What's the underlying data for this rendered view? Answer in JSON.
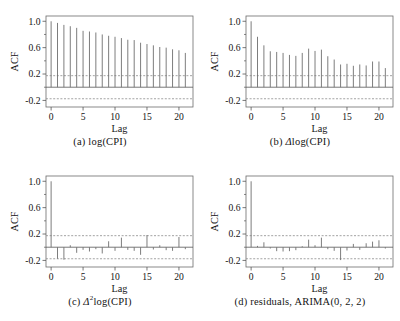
{
  "figure": {
    "background": "#ffffff",
    "stem_color": "#6e6e6e",
    "axis_color": "#555555",
    "bound_color": "#8c8c8c",
    "frame_color": "#6b6b6b"
  },
  "panels": [
    {
      "key": "a",
      "caption_prefix": "(a)",
      "caption_text": "log(CPI)",
      "caption_delta": "",
      "caption_sup": ""
    },
    {
      "key": "b",
      "caption_prefix": "(b)",
      "caption_text": "log(CPI)",
      "caption_delta": "Δ",
      "caption_sup": ""
    },
    {
      "key": "c",
      "caption_prefix": "(c)",
      "caption_text": "log(CPI)",
      "caption_delta": "Δ",
      "caption_sup": "2"
    },
    {
      "key": "d",
      "caption_prefix": "(d)",
      "caption_text": "residuals, ARIMA(0, 2, 2)",
      "caption_delta": "",
      "caption_sup": ""
    }
  ],
  "chart_data": [
    {
      "id": "a",
      "type": "bar",
      "title": "(a) log(CPI)",
      "xlabel": "Lag",
      "ylabel": "ACF",
      "xlim": [
        -0.8,
        22.2
      ],
      "ylim": [
        -0.3,
        1.08
      ],
      "xticks": [
        0,
        5,
        10,
        15,
        20
      ],
      "yticks": [
        -0.2,
        0.2,
        0.6,
        1.0
      ],
      "ytick_labels": [
        "-0.2",
        "0.2",
        "0.6",
        "1.0"
      ],
      "grid": false,
      "legend": "none",
      "confidence_bounds": [
        0.175,
        -0.175
      ],
      "zero_line": 0,
      "x": [
        0,
        1,
        2,
        3,
        4,
        5,
        6,
        7,
        8,
        9,
        10,
        11,
        12,
        13,
        14,
        15,
        16,
        17,
        18,
        19,
        20,
        21
      ],
      "values": [
        1.0,
        0.975,
        0.945,
        0.925,
        0.9,
        0.855,
        0.845,
        0.83,
        0.8,
        0.78,
        0.765,
        0.745,
        0.72,
        0.715,
        0.675,
        0.655,
        0.635,
        0.61,
        0.6,
        0.575,
        0.56,
        0.52
      ]
    },
    {
      "id": "b",
      "type": "bar",
      "title": "(b) Δlog(CPI)",
      "xlabel": "Lag",
      "ylabel": "ACF",
      "xlim": [
        -0.8,
        22.2
      ],
      "ylim": [
        -0.3,
        1.08
      ],
      "xticks": [
        0,
        5,
        10,
        15,
        20
      ],
      "yticks": [
        -0.2,
        0.2,
        0.6,
        1.0
      ],
      "ytick_labels": [
        "-0.2",
        "0.2",
        "0.6",
        "1.0"
      ],
      "grid": false,
      "legend": "none",
      "confidence_bounds": [
        0.175,
        -0.175
      ],
      "zero_line": 0,
      "x": [
        0,
        1,
        2,
        3,
        4,
        5,
        6,
        7,
        8,
        9,
        10,
        11,
        12,
        13,
        14,
        15,
        16,
        17,
        18,
        19,
        20,
        21
      ],
      "values": [
        1.0,
        0.765,
        0.635,
        0.545,
        0.535,
        0.52,
        0.49,
        0.475,
        0.52,
        0.585,
        0.55,
        0.57,
        0.47,
        0.42,
        0.345,
        0.355,
        0.325,
        0.345,
        0.33,
        0.39,
        0.39,
        0.29
      ]
    },
    {
      "id": "c",
      "type": "bar",
      "title": "(c) Δ2log(CPI)",
      "xlabel": "Lag",
      "ylabel": "ACF",
      "xlim": [
        -0.8,
        22.2
      ],
      "ylim": [
        -0.3,
        1.08
      ],
      "xticks": [
        0,
        5,
        10,
        15,
        20
      ],
      "yticks": [
        -0.2,
        0.2,
        0.6,
        1.0
      ],
      "ytick_labels": [
        "-0.2",
        "0.2",
        "0.6",
        "1.0"
      ],
      "grid": false,
      "legend": "none",
      "confidence_bounds": [
        0.175,
        -0.175
      ],
      "zero_line": 0,
      "x": [
        0,
        1,
        2,
        3,
        4,
        5,
        6,
        7,
        8,
        9,
        10,
        11,
        12,
        13,
        14,
        15,
        16,
        17,
        18,
        19,
        20,
        21
      ],
      "values": [
        1.0,
        -0.175,
        -0.19,
        0.03,
        -0.085,
        -0.04,
        -0.065,
        -0.03,
        -0.095,
        0.09,
        -0.055,
        0.145,
        -0.04,
        -0.055,
        -0.115,
        0.185,
        -0.035,
        0.03,
        -0.045,
        -0.055,
        0.155,
        -0.03
      ]
    },
    {
      "id": "d",
      "type": "bar",
      "title": "(d) residuals, ARIMA(0, 2, 2)",
      "xlabel": "Lag",
      "ylabel": "ACF",
      "xlim": [
        -0.8,
        22.2
      ],
      "ylim": [
        -0.3,
        1.08
      ],
      "xticks": [
        0,
        5,
        10,
        15,
        20
      ],
      "yticks": [
        -0.2,
        0.2,
        0.6,
        1.0
      ],
      "ytick_labels": [
        "-0.2",
        "0.2",
        "0.6",
        "1.0"
      ],
      "grid": false,
      "legend": "none",
      "confidence_bounds": [
        0.175,
        -0.175
      ],
      "zero_line": 0,
      "x": [
        0,
        1,
        2,
        3,
        4,
        5,
        6,
        7,
        8,
        9,
        10,
        11,
        12,
        13,
        14,
        15,
        16,
        17,
        18,
        19,
        20,
        21
      ],
      "values": [
        1.0,
        0.02,
        0.075,
        -0.02,
        -0.06,
        -0.065,
        -0.06,
        -0.045,
        0.015,
        0.115,
        0.03,
        0.145,
        -0.03,
        -0.055,
        -0.195,
        -0.05,
        0.05,
        -0.04,
        0.06,
        0.085,
        0.105,
        -0.02
      ]
    }
  ]
}
